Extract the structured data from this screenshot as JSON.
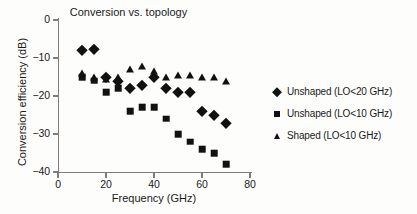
{
  "chart_data": {
    "type": "scatter",
    "title": "Conversion vs. topology",
    "xlabel": "Frequency (GHz)",
    "ylabel": "Conversion efficiency (dB)",
    "xlim": [
      0,
      80
    ],
    "ylim": [
      -40,
      0
    ],
    "xticks": [
      0,
      20,
      40,
      60,
      80
    ],
    "yticks": [
      0,
      -10,
      -20,
      -30,
      -40
    ],
    "xtick_labels": [
      "0",
      "20",
      "40",
      "60",
      "80"
    ],
    "ytick_labels": [
      "0",
      "−10",
      "−20",
      "−30",
      "−40"
    ],
    "grid": false,
    "legend_position": "right",
    "series": [
      {
        "name": "Unshaped (LO<20 GHz)",
        "marker": "diamond",
        "color": "#111111",
        "x": [
          10,
          15,
          20,
          25,
          30,
          35,
          40,
          45,
          50,
          55,
          60,
          65,
          70
        ],
        "y": [
          -8,
          -7.5,
          -15,
          -16,
          -18,
          -17,
          -15,
          -18,
          -19,
          -19,
          -24,
          -25,
          -27
        ]
      },
      {
        "name": "Unshaped (LO<10 GHz)",
        "marker": "square",
        "color": "#111111",
        "x": [
          10,
          15,
          20,
          25,
          30,
          35,
          40,
          45,
          50,
          55,
          60,
          65,
          70
        ],
        "y": [
          -15,
          -16,
          -19,
          -18,
          -24,
          -23,
          -23,
          -26,
          -30,
          -32,
          -34,
          -35,
          -38
        ]
      },
      {
        "name": "Shaped (LO<10 GHz)",
        "marker": "triangle",
        "color": "#111111",
        "x": [
          10,
          15,
          20,
          25,
          30,
          35,
          40,
          45,
          50,
          55,
          60,
          65,
          70
        ],
        "y": [
          -14,
          -15,
          -15.5,
          -15,
          -13,
          -12,
          -13.5,
          -15,
          -14.5,
          -14.5,
          -15,
          -15,
          -16
        ]
      }
    ]
  },
  "legend": {
    "items": [
      {
        "label": "Unshaped (LO<20 GHz)",
        "marker": "diamond"
      },
      {
        "label": "Unshaped (LO<10 GHz)",
        "marker": "square"
      },
      {
        "label": "Shaped (LO<10 GHz)",
        "marker": "triangle"
      }
    ]
  }
}
